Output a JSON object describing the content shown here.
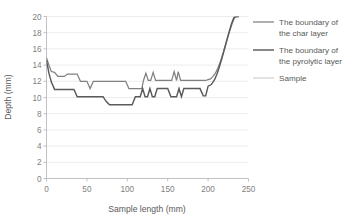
{
  "chart_data": {
    "type": "line",
    "title": "",
    "xlabel": "Sample length (mm)",
    "ylabel": "Depth (mm)",
    "xlim": [
      0,
      250
    ],
    "ylim": [
      0,
      20
    ],
    "xticks": [
      0,
      50,
      100,
      150,
      200,
      250
    ],
    "yticks": [
      0,
      2,
      4,
      6,
      8,
      10,
      12,
      14,
      16,
      18,
      20
    ],
    "grid": "horizontal",
    "legend_position": "right",
    "series": [
      {
        "name": "The boundary of the char layer",
        "color": "#808080",
        "x": [
          0,
          3,
          6,
          10,
          14,
          18,
          22,
          26,
          30,
          34,
          38,
          42,
          46,
          50,
          54,
          58,
          62,
          66,
          70,
          74,
          78,
          82,
          86,
          90,
          94,
          98,
          102,
          106,
          110,
          114,
          118,
          120,
          123,
          126,
          129,
          132,
          135,
          138,
          141,
          145,
          150,
          155,
          158,
          161,
          163,
          166,
          169,
          173,
          178,
          183,
          188,
          193,
          197,
          200,
          203,
          206,
          209,
          212,
          215,
          218,
          221,
          224,
          227,
          230,
          233,
          236,
          238
        ],
        "y": [
          14.9,
          14.0,
          13.2,
          13.1,
          12.6,
          12.6,
          12.6,
          12.9,
          12.9,
          12.9,
          12.9,
          12.0,
          12.0,
          12.0,
          11.1,
          12.0,
          12.0,
          12.0,
          12.0,
          12.0,
          12.0,
          12.0,
          12.0,
          12.0,
          12.0,
          12.0,
          11.1,
          11.1,
          11.1,
          11.1,
          11.1,
          12.1,
          13.0,
          12.1,
          12.1,
          13.1,
          12.1,
          12.1,
          12.1,
          12.1,
          12.1,
          12.1,
          13.2,
          12.1,
          13.2,
          12.1,
          12.1,
          12.1,
          12.1,
          12.1,
          12.1,
          12.1,
          12.1,
          12.2,
          12.3,
          12.6,
          13.0,
          13.6,
          14.4,
          15.3,
          16.3,
          17.3,
          18.3,
          19.2,
          19.9,
          20.0,
          20.0
        ]
      },
      {
        "name": "The boundary of the pyrolytic layer",
        "color": "#5a5a5a",
        "x": [
          0,
          3,
          6,
          10,
          14,
          18,
          22,
          26,
          30,
          34,
          38,
          42,
          46,
          50,
          54,
          58,
          62,
          66,
          70,
          74,
          78,
          82,
          86,
          90,
          94,
          98,
          102,
          106,
          110,
          113,
          116,
          119,
          122,
          125,
          128,
          131,
          134,
          137,
          140,
          143,
          146,
          150,
          154,
          158,
          161,
          164,
          167,
          170,
          174,
          178,
          182,
          186,
          190,
          194,
          197,
          200,
          204,
          208,
          211,
          214,
          217,
          220,
          223,
          226,
          229,
          232,
          235,
          238
        ],
        "y": [
          14.6,
          13.0,
          11.9,
          11.0,
          11.0,
          11.0,
          11.0,
          11.0,
          11.0,
          11.0,
          10.1,
          10.1,
          10.1,
          10.1,
          10.1,
          10.1,
          10.1,
          10.1,
          10.1,
          9.5,
          9.1,
          9.1,
          9.1,
          9.1,
          9.1,
          9.1,
          9.1,
          9.1,
          10.1,
          10.1,
          10.1,
          11.1,
          10.1,
          10.1,
          11.1,
          10.1,
          10.1,
          11.1,
          11.1,
          11.1,
          11.1,
          11.1,
          10.1,
          10.1,
          10.1,
          11.1,
          10.1,
          11.1,
          11.1,
          11.1,
          11.1,
          11.1,
          11.1,
          10.2,
          10.2,
          11.4,
          11.6,
          12.2,
          12.9,
          13.8,
          14.8,
          15.9,
          17.0,
          18.1,
          19.1,
          19.9,
          20.0,
          20.0
        ]
      },
      {
        "name": "Sample",
        "color": "#bfbfbf",
        "x": [],
        "y": []
      }
    ]
  },
  "legend": {
    "items": [
      {
        "label_line1": "The boundary of",
        "label_line2": "the char layer",
        "swatch": "char-swatch"
      },
      {
        "label_line1": "The boundary of",
        "label_line2": "the pyrolytic layer",
        "swatch": "pyrolytic-swatch"
      },
      {
        "label_line1": "Sample",
        "label_line2": "",
        "swatch": "sample-swatch"
      }
    ]
  },
  "axes": {
    "y_label": "Depth (mm)",
    "x_label": "Sample length (mm)",
    "y_ticks": [
      "20",
      "18",
      "16",
      "14",
      "12",
      "10",
      "8",
      "6",
      "4",
      "2",
      "0"
    ],
    "x_ticks": [
      "0",
      "50",
      "100",
      "150",
      "200",
      "250"
    ]
  },
  "colors": {
    "grid": "#e4e4e4",
    "axis": "#b3b3b3",
    "text": "#595959",
    "char_layer": "#808080",
    "pyrolytic_layer": "#5a5a5a",
    "sample": "#bfbfbf"
  }
}
